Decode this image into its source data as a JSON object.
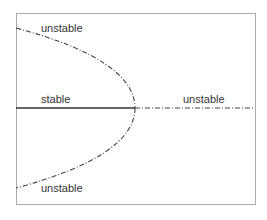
{
  "diagram": {
    "type": "bifurcation-diagram",
    "labels": {
      "upper_branch": "unstable",
      "stable_branch": "stable",
      "right_branch": "unstable",
      "lower_branch": "unstable"
    },
    "colors": {
      "frame": "#999999",
      "line": "#333333"
    }
  }
}
